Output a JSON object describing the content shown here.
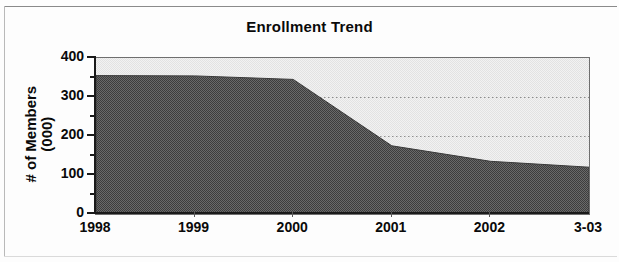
{
  "chart_data": {
    "type": "area",
    "title": "Enrollment Trend",
    "xlabel": "",
    "ylabel": "# of Members (000)",
    "ylabel_line1": "# of Members",
    "ylabel_line2": "(000)",
    "categories": [
      "1998",
      "1999",
      "2000",
      "2001",
      "2002",
      "3-03"
    ],
    "values": [
      355,
      354,
      345,
      175,
      135,
      120
    ],
    "series": [
      {
        "name": "# of Members (000)",
        "values": [
          355,
          354,
          345,
          175,
          135,
          120
        ]
      }
    ],
    "ylim": [
      0,
      400
    ],
    "yticks": [
      0,
      100,
      200,
      300,
      400
    ],
    "ytick_labels": [
      "0",
      "100",
      "200",
      "300",
      "400"
    ],
    "yticks_minor": [
      50,
      150,
      250,
      350
    ],
    "xtick_labels": [
      "1998",
      "1999",
      "2000",
      "2001",
      "2002",
      "3-03"
    ],
    "grid": true,
    "gridlines_y": [
      200,
      300
    ],
    "legend": "none",
    "area_fill_color": "#5a5a5a",
    "plot_background_color": "#eeeeee",
    "axis_color": "#1a1a1a",
    "gridline_color": "#9a9a9a"
  },
  "colors": {
    "axis": "#1a1a1a",
    "area_fill": "#5a5a5a",
    "plot_bg": "#eeeeee",
    "page_bg": "#fdfdfd",
    "text": "#0a0a0a"
  }
}
